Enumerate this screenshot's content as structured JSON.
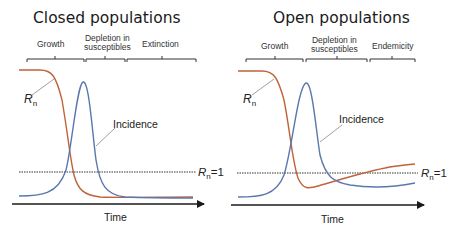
{
  "colors": {
    "rn_curve": "#c0623a",
    "incidence_curve": "#5a78b0",
    "axis": "#1a1a1a",
    "threshold": "#333333"
  },
  "panels": [
    {
      "title": "Closed populations",
      "phases": [
        {
          "line1": "Growth",
          "line2": ""
        },
        {
          "line1": "Depletion in",
          "line2": "susceptibles"
        },
        {
          "line1": "Extinction",
          "line2": ""
        }
      ],
      "rn_label": "R",
      "rn_sub": "n",
      "incidence_label": "Incidence",
      "threshold_label_r": "R",
      "threshold_label_sub": "n",
      "threshold_label_val": "=1",
      "x_axis_label": "Time"
    },
    {
      "title": "Open populations",
      "phases": [
        {
          "line1": "Growth",
          "line2": ""
        },
        {
          "line1": "Depletion in",
          "line2": "susceptibles"
        },
        {
          "line1": "Endemicity",
          "line2": ""
        }
      ],
      "rn_label": "R",
      "rn_sub": "n",
      "incidence_label": "Incidence",
      "threshold_label_r": "R",
      "threshold_label_sub": "n",
      "threshold_label_val": "=1",
      "x_axis_label": "Time"
    }
  ]
}
